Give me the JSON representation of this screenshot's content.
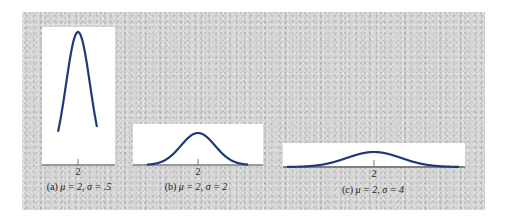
{
  "figure": {
    "background_color": "#d4d4d4",
    "curve_color": "#1f3a7a",
    "axis_color": "#333333"
  },
  "chart_data": [
    {
      "type": "line",
      "title": "(a) μ = 2, σ = .5",
      "label": "(a)",
      "mu": 2,
      "sigma": 0.5,
      "mu_text": "μ = 2,",
      "sigma_text": "σ = .5",
      "xticks": [
        "2"
      ],
      "xlabel": "",
      "ylabel": "",
      "grid": false,
      "x": [
        0.5,
        1.0,
        1.25,
        1.5,
        1.75,
        2.0,
        2.25,
        2.5,
        2.75,
        3.0,
        3.5
      ],
      "y": [
        0.009,
        0.108,
        0.259,
        0.484,
        0.704,
        0.798,
        0.704,
        0.484,
        0.259,
        0.108,
        0.009
      ]
    },
    {
      "type": "line",
      "title": "(b) μ = 2, σ = 2",
      "label": "(b)",
      "mu": 2,
      "sigma": 2,
      "mu_text": "μ = 2,",
      "sigma_text": "σ = 2",
      "xticks": [
        "2"
      ],
      "xlabel": "",
      "ylabel": "",
      "grid": false,
      "x": [
        -4,
        -2,
        0,
        1,
        2,
        3,
        4,
        6,
        8
      ],
      "y": [
        0.002,
        0.027,
        0.121,
        0.176,
        0.199,
        0.176,
        0.121,
        0.027,
        0.002
      ]
    },
    {
      "type": "line",
      "title": "(c) μ = 2, σ = 4",
      "label": "(c)",
      "mu": 2,
      "sigma": 4,
      "mu_text": "μ = 2,",
      "sigma_text": "σ = 4",
      "xticks": [
        "2"
      ],
      "xlabel": "",
      "ylabel": "",
      "grid": false,
      "x": [
        -10,
        -6,
        -2,
        0,
        2,
        4,
        6,
        10,
        14
      ],
      "y": [
        0.001,
        0.013,
        0.06,
        0.088,
        0.1,
        0.088,
        0.06,
        0.013,
        0.001
      ]
    }
  ]
}
